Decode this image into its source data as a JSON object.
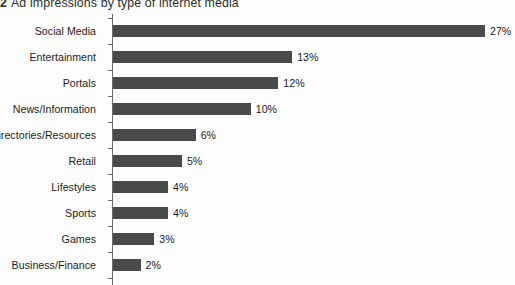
{
  "title": {
    "figure_number": "2",
    "text": "Ad impressions by type of internet media",
    "full": "2 Ad impressions by type of internet media"
  },
  "colors": {
    "bar": "#4a4a4a",
    "axis": "#6a6a6a",
    "text": "#1c1c1c",
    "background": "#fdfdfd"
  },
  "chart_data": {
    "type": "bar",
    "orientation": "horizontal",
    "xlabel": "",
    "ylabel": "",
    "xlim": [
      0,
      28
    ],
    "grid": false,
    "legend": false,
    "value_suffix": "%",
    "categories": [
      "Social Media",
      "Entertainment",
      "Portals",
      "News/Information",
      "Directories/Resources",
      "Retail",
      "Lifestyles",
      "Sports",
      "Games",
      "Business/Finance"
    ],
    "values": [
      27,
      13,
      12,
      10,
      6,
      5,
      4,
      4,
      3,
      2
    ],
    "labels": [
      "27%",
      "13%",
      "12%",
      "10%",
      "6%",
      "5%",
      "4%",
      "4%",
      "3%",
      "2%"
    ]
  },
  "rows": [
    {
      "label": "Social Media",
      "value": 27,
      "value_label": "27%"
    },
    {
      "label": "Entertainment",
      "value": 13,
      "value_label": "13%"
    },
    {
      "label": "Portals",
      "value": 12,
      "value_label": "12%"
    },
    {
      "label": "News/Information",
      "value": 10,
      "value_label": "10%"
    },
    {
      "label": "Directories/Resources",
      "value": 6,
      "value_label": "6%"
    },
    {
      "label": "Retail",
      "value": 5,
      "value_label": "5%"
    },
    {
      "label": "Lifestyles",
      "value": 4,
      "value_label": "4%"
    },
    {
      "label": "Sports",
      "value": 4,
      "value_label": "4%"
    },
    {
      "label": "Games",
      "value": 3,
      "value_label": "3%"
    },
    {
      "label": "Business/Finance",
      "value": 2,
      "value_label": "2%"
    }
  ]
}
